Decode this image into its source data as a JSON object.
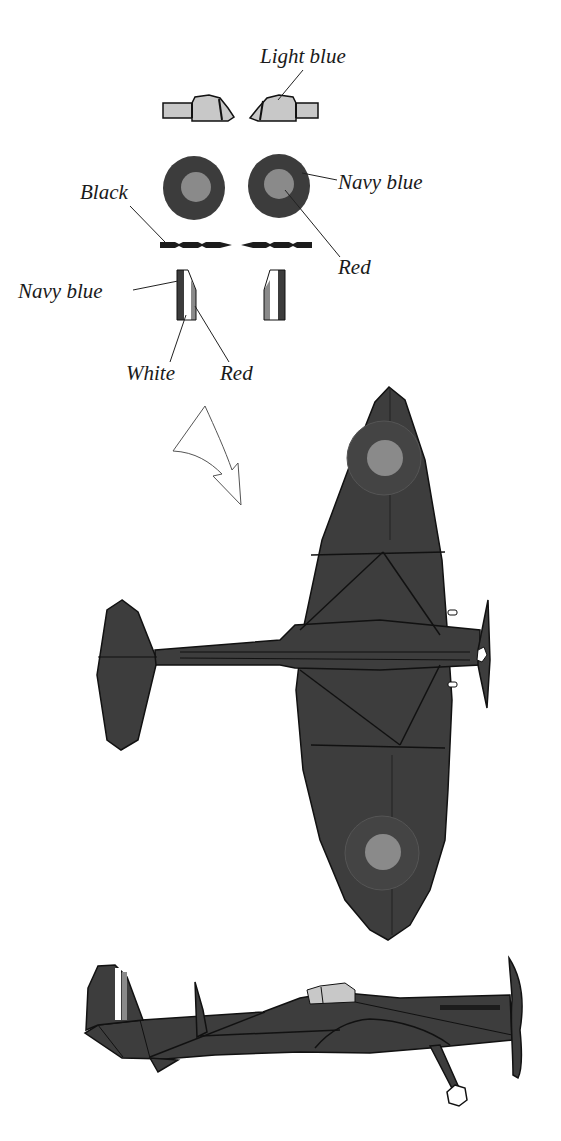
{
  "labels": {
    "light_blue": "Light blue",
    "black": "Black",
    "navy_blue_roundel": "Navy blue",
    "red_roundel": "Red",
    "navy_blue_fin": "Navy blue",
    "white_fin": "White",
    "red_fin": "Red"
  },
  "colors": {
    "light_blue": "#c8c8c8",
    "navy_blue": "#3c3c3c",
    "red": "#8a8a8a",
    "black": "#1c1c1c",
    "white": "#ffffff",
    "aircraft_body": "#3d3d3d",
    "outline": "#111111"
  },
  "views": {
    "top_view": "Aircraft top view with roundels",
    "side_view": "Aircraft side view with canopy, fin flash and landing gear"
  }
}
